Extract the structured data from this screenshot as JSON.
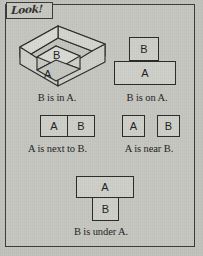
{
  "page": {
    "background_color": "#c2c2bd",
    "frame_color": "#3a3a38"
  },
  "header": {
    "tab_label": "Look!"
  },
  "figures": [
    {
      "id": "b-in-a",
      "type": "isometric-open-box",
      "caption": "B is in A.",
      "outer_label": "A",
      "inner_label": "B"
    },
    {
      "id": "b-on-a",
      "type": "stacked-boxes",
      "caption": "B is on A.",
      "top_label": "B",
      "bottom_label": "A"
    },
    {
      "id": "a-next-to-b",
      "type": "adjacent-boxes",
      "caption": "A is next to B.",
      "left_label": "A",
      "right_label": "B"
    },
    {
      "id": "a-near-b",
      "type": "separated-boxes",
      "caption": "A is near B.",
      "left_label": "A",
      "right_label": "B"
    },
    {
      "id": "b-under-a",
      "type": "stacked-boxes-inverted",
      "caption": "B is under A.",
      "top_label": "A",
      "bottom_label": "B"
    }
  ]
}
